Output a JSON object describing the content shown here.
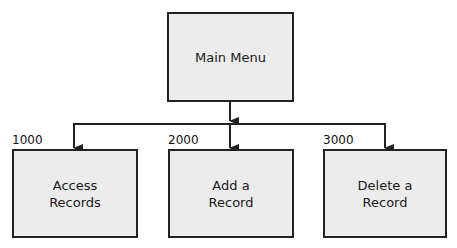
{
  "diagram": {
    "type": "hierarchy-chart",
    "root": {
      "label": "Main Menu"
    },
    "children": [
      {
        "code": "1000",
        "label_line1": "Access",
        "label_line2": "Records"
      },
      {
        "code": "2000",
        "label_line1": "Add a",
        "label_line2": "Record"
      },
      {
        "code": "3000",
        "label_line1": "Delete a",
        "label_line2": "Record"
      }
    ]
  },
  "colors": {
    "box_fill": "#ececec",
    "line": "#222222"
  }
}
